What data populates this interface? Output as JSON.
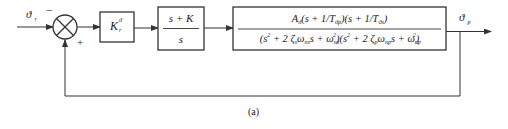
{
  "diagram": {
    "type": "block-diagram",
    "input_signal": "ϑ r",
    "input_symbol": "ϑ",
    "input_subscript": "r",
    "output_signal": "ϑ p",
    "output_symbol": "ϑ",
    "output_subscript": "p",
    "summing_junction": {
      "minus_sign": "−",
      "plus_sign": "+"
    },
    "blocks": [
      {
        "id": "gain",
        "label": "K_r^ϑ",
        "main": "K",
        "sub": "r",
        "sup": "ϑ"
      },
      {
        "id": "pi-controller",
        "numerator": "s + K",
        "denominator": "s"
      },
      {
        "id": "plant",
        "numerator": "A_ϑ(s + 1/T_ϑp)(s + 1/T_ϑs)",
        "denominator": "(s² + 2ζ_s ω_ns s + ω_ns²)(s² + 2ζ_p ω_np s + ω_np²)"
      }
    ],
    "caption": "(a)"
  },
  "colors": {
    "line": "#333333",
    "text": "#1a1a1a",
    "background": "#ffffff"
  }
}
